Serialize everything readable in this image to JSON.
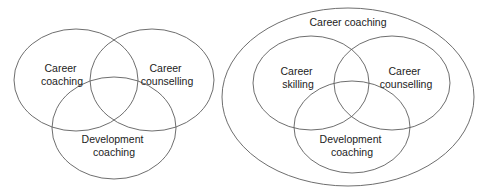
{
  "figure": {
    "type": "venn-diagram-pair",
    "line_color": "#5e5e5e",
    "text_color": "#1c1c1c",
    "background_color": "#ffffff",
    "diagrams": [
      {
        "id": "left",
        "name": "three-overlapping-circles",
        "outer": null,
        "circles": [
          {
            "id": "career-coaching",
            "label_lines": [
              "Career",
              "coaching"
            ],
            "line1": "Career",
            "line2": "coaching",
            "cx": 76,
            "cy": 80,
            "rx": 62,
            "ry": 51,
            "label_x": 62,
            "label_y": 72
          },
          {
            "id": "career-counselling",
            "label_lines": [
              "Career",
              "counselling"
            ],
            "line1": "Career",
            "line2": "counselling",
            "cx": 152,
            "cy": 80,
            "rx": 62,
            "ry": 51,
            "label_x": 167,
            "label_y": 72
          },
          {
            "id": "development-coaching",
            "label_lines": [
              "Development",
              "coaching"
            ],
            "line1": "Development",
            "line2": "coaching",
            "cx": 114,
            "cy": 128,
            "rx": 62,
            "ry": 51,
            "label_x": 114,
            "label_y": 143
          }
        ]
      },
      {
        "id": "right",
        "name": "three-overlapping-circles-inside-outer-ellipse",
        "outer": {
          "id": "career-coaching-outer",
          "label_lines": [
            "Career coaching"
          ],
          "line1": "Career coaching",
          "cx": 348,
          "cy": 97,
          "rx": 126,
          "ry": 89,
          "label_x": 348,
          "label_y": 26
        },
        "circles": [
          {
            "id": "career-skilling",
            "label_lines": [
              "Career",
              "skilling"
            ],
            "line1": "Career",
            "line2": "skilling",
            "cx": 311,
            "cy": 83,
            "rx": 58,
            "ry": 47,
            "label_x": 298,
            "label_y": 75
          },
          {
            "id": "career-counselling",
            "label_lines": [
              "Career",
              "counselling"
            ],
            "line1": "Career",
            "line2": "counselling",
            "cx": 392,
            "cy": 83,
            "rx": 58,
            "ry": 47,
            "label_x": 406,
            "label_y": 75
          },
          {
            "id": "development-coaching",
            "label_lines": [
              "Development",
              "coaching"
            ],
            "line1": "Development",
            "line2": "coaching",
            "cx": 352,
            "cy": 127,
            "rx": 58,
            "ry": 46,
            "label_x": 352,
            "label_y": 143
          }
        ]
      }
    ]
  }
}
